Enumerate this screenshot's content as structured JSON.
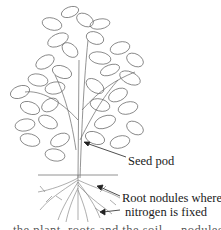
{
  "figure": {
    "labels": {
      "seed_pod": "Seed pod",
      "root_nodules_line1": "Root nodules where",
      "root_nodules_line2": "nitrogen is fixed"
    },
    "caption_partial": "...the plant, roots and the soil ... nodules ... soil ..."
  },
  "colors": {
    "line_art": "#555555",
    "text": "#1a1a1a",
    "background": "#ffffff"
  }
}
